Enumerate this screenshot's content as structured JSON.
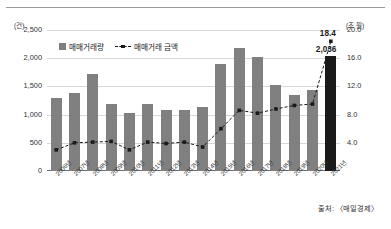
{
  "chart_data": {
    "type": "bar",
    "title": "",
    "subtitle": "",
    "xlabel": "",
    "categories": [
      "2006년",
      "2007년",
      "2008년",
      "2009년",
      "2010년",
      "2011년",
      "2012년",
      "2013년",
      "2014년",
      "2015년",
      "2016년",
      "2017년",
      "2018년",
      "2019년",
      "2020년",
      "2021년"
    ],
    "series": [
      {
        "name": "매매거래량",
        "type": "bar",
        "axis": "left",
        "unit": "건",
        "values": [
          1290,
          1380,
          1720,
          1190,
          1030,
          1190,
          1080,
          1090,
          1130,
          1900,
          2180,
          2020,
          1530,
          1350,
          1440,
          2036
        ]
      },
      {
        "name": "매매거래 금액",
        "type": "line",
        "axis": "right",
        "unit": "조 원",
        "values": [
          3.0,
          4.0,
          4.1,
          4.2,
          3.0,
          4.1,
          3.9,
          4.1,
          3.4,
          6.0,
          8.6,
          8.2,
          8.8,
          9.3,
          9.5,
          18.4
        ]
      }
    ],
    "left_axis": {
      "unit_label": "(건)",
      "ticks": [
        "2,500",
        "2,000",
        "1,500",
        "1,000",
        "500",
        "0"
      ],
      "tick_values": [
        2500,
        2000,
        1500,
        1000,
        500,
        0
      ],
      "min": 0,
      "max": 2500
    },
    "right_axis": {
      "unit_label": "(조 원)",
      "ticks": [
        "20.0",
        "16.0",
        "12.0",
        "8.0",
        "4.0",
        ""
      ],
      "tick_values": [
        20.0,
        16.0,
        12.0,
        8.0,
        4.0,
        0
      ],
      "min": 0,
      "max": 20.0
    },
    "grid": true,
    "legend": {
      "position": "top-left",
      "entries": [
        {
          "label": "매매거래량",
          "marker": "bar",
          "color": "#808080"
        },
        {
          "label": "매매거래 금액",
          "marker": "dashed-line-square",
          "color": "#1a1a1a"
        }
      ]
    },
    "annotations": [
      {
        "label": "18.4",
        "series": "매매거래 금액",
        "category": "2021년"
      },
      {
        "label": "2,036",
        "series": "매매거래량",
        "category": "2021년"
      }
    ],
    "highlight": {
      "category": "2021년",
      "color": "#1a1a1a"
    },
    "colors": {
      "bar": "#808080",
      "bar_highlight": "#1a1a1a",
      "line": "#1a1a1a",
      "grid": "#d8d8d8"
    }
  },
  "footer": {
    "source": "출처: 〈매일경제〉"
  }
}
